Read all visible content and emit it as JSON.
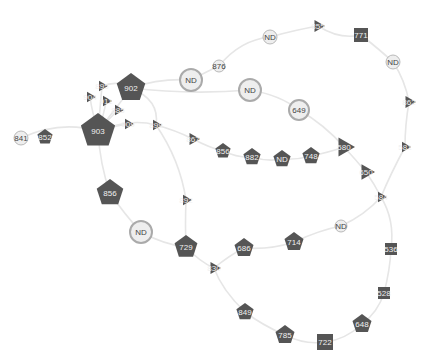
{
  "diagram": {
    "type": "network-graph",
    "colors": {
      "dark_node": "#555555",
      "light_node_fill": "#eeeeee",
      "light_node_stroke": "#aaaaaa",
      "edge": "#e6e6e6"
    },
    "nodes": [
      {
        "id": "n841",
        "label": "841",
        "shape": "circle-plain",
        "x": 21,
        "y": 138,
        "r": 7
      },
      {
        "id": "n852",
        "label": "852",
        "shape": "pentagon",
        "x": 45,
        "y": 137,
        "r": 8
      },
      {
        "id": "n903",
        "label": "903",
        "shape": "pentagon",
        "x": 98,
        "y": 131,
        "r": 18
      },
      {
        "id": "n902",
        "label": "902",
        "shape": "pentagon",
        "x": 131,
        "y": 88,
        "r": 15
      },
      {
        "id": "n895",
        "label": "895",
        "shape": "triangle",
        "x": 102,
        "y": 86,
        "r": 6
      },
      {
        "id": "n904",
        "label": "904",
        "shape": "triangle",
        "x": 90,
        "y": 97,
        "r": 6
      },
      {
        "id": "n911",
        "label": "911",
        "shape": "triangle",
        "x": 106,
        "y": 101,
        "r": 6
      },
      {
        "id": "n885",
        "label": "885",
        "shape": "triangle",
        "x": 118,
        "y": 110,
        "r": 6
      },
      {
        "id": "n909",
        "label": "909",
        "shape": "triangle",
        "x": 128,
        "y": 124,
        "r": 6
      },
      {
        "id": "n899",
        "label": "899",
        "shape": "triangle",
        "x": 156,
        "y": 125,
        "r": 6
      },
      {
        "id": "nND1",
        "label": "ND",
        "shape": "circle-ring",
        "x": 191,
        "y": 80,
        "r": 11
      },
      {
        "id": "n876",
        "label": "876",
        "shape": "circle-plain",
        "x": 219,
        "y": 66,
        "r": 6
      },
      {
        "id": "nND2",
        "label": "ND",
        "shape": "circle-ring",
        "x": 250,
        "y": 90,
        "r": 11
      },
      {
        "id": "nND3",
        "label": "ND",
        "shape": "circle-plain",
        "x": 270,
        "y": 37,
        "r": 7
      },
      {
        "id": "n649",
        "label": "649",
        "shape": "circle-ring",
        "x": 299,
        "y": 110,
        "r": 10
      },
      {
        "id": "n855",
        "label": "855",
        "shape": "triangle",
        "x": 318,
        "y": 26,
        "r": 7
      },
      {
        "id": "n771",
        "label": "771",
        "shape": "square",
        "x": 361,
        "y": 35,
        "r": 7
      },
      {
        "id": "nND4",
        "label": "ND",
        "shape": "circle-plain",
        "x": 393,
        "y": 62,
        "r": 7
      },
      {
        "id": "n862",
        "label": "862",
        "shape": "triangle",
        "x": 409,
        "y": 102,
        "r": 7
      },
      {
        "id": "n581",
        "label": "581",
        "shape": "triangle",
        "x": 405,
        "y": 147,
        "r": 6
      },
      {
        "id": "n867",
        "label": "867",
        "shape": "triangle",
        "x": 193,
        "y": 139,
        "r": 7
      },
      {
        "id": "n856",
        "label": "856",
        "shape": "pentagon",
        "x": 223,
        "y": 151,
        "r": 8
      },
      {
        "id": "n882",
        "label": "882",
        "shape": "pentagon",
        "x": 252,
        "y": 157,
        "r": 9
      },
      {
        "id": "nNDp",
        "label": "ND",
        "shape": "pentagon",
        "x": 282,
        "y": 159,
        "r": 9
      },
      {
        "id": "n748",
        "label": "748",
        "shape": "pentagon",
        "x": 311,
        "y": 156,
        "r": 9
      },
      {
        "id": "n580",
        "label": "580",
        "shape": "triangle",
        "x": 344,
        "y": 147,
        "r": 11
      },
      {
        "id": "n650",
        "label": "650",
        "shape": "triangle",
        "x": 366,
        "y": 172,
        "r": 9
      },
      {
        "id": "n584",
        "label": "584",
        "shape": "triangle",
        "x": 381,
        "y": 197,
        "r": 6
      },
      {
        "id": "n856b",
        "label": "856",
        "shape": "pentagon",
        "x": 110,
        "y": 193,
        "r": 14
      },
      {
        "id": "n892",
        "label": "892",
        "shape": "triangle",
        "x": 186,
        "y": 200,
        "r": 6
      },
      {
        "id": "nND5",
        "label": "ND",
        "shape": "circle-ring",
        "x": 141,
        "y": 232,
        "r": 11
      },
      {
        "id": "n729",
        "label": "729",
        "shape": "pentagon",
        "x": 186,
        "y": 247,
        "r": 12
      },
      {
        "id": "n686",
        "label": "686",
        "shape": "pentagon",
        "x": 244,
        "y": 248,
        "r": 10
      },
      {
        "id": "n714",
        "label": "714",
        "shape": "pentagon",
        "x": 294,
        "y": 242,
        "r": 10
      },
      {
        "id": "nND6",
        "label": "ND",
        "shape": "circle-plain",
        "x": 341,
        "y": 226,
        "r": 6
      },
      {
        "id": "n830",
        "label": "830",
        "shape": "triangle",
        "x": 214,
        "y": 268,
        "r": 7
      },
      {
        "id": "n536",
        "label": "536",
        "shape": "square",
        "x": 391,
        "y": 249,
        "r": 6
      },
      {
        "id": "n528",
        "label": "528",
        "shape": "square",
        "x": 384,
        "y": 293,
        "r": 6
      },
      {
        "id": "n849",
        "label": "849",
        "shape": "pentagon",
        "x": 245,
        "y": 312,
        "r": 9
      },
      {
        "id": "n785",
        "label": "785",
        "shape": "pentagon",
        "x": 285,
        "y": 335,
        "r": 10
      },
      {
        "id": "n722",
        "label": "722",
        "shape": "square",
        "x": 325,
        "y": 342,
        "r": 8
      },
      {
        "id": "n648",
        "label": "648",
        "shape": "pentagon",
        "x": 362,
        "y": 324,
        "r": 10
      }
    ],
    "edges": [
      {
        "d": "M21 138 Q60 120 98 131"
      },
      {
        "d": "M98 131 Q115 110 131 88"
      },
      {
        "d": "M98 131 Q100 108 102 86"
      },
      {
        "d": "M98 131 Q92 112 90 97"
      },
      {
        "d": "M98 131 Q104 115 106 101"
      },
      {
        "d": "M98 131 Q110 118 118 110"
      },
      {
        "d": "M98 131 Q114 126 128 124"
      },
      {
        "d": "M98 131 Q130 118 156 125"
      },
      {
        "d": "M131 88 Q160 78 191 80"
      },
      {
        "d": "M102 86 Q118 80 131 88"
      },
      {
        "d": "M131 88 Q160 100 156 125"
      },
      {
        "d": "M191 80 Q210 70 219 66"
      },
      {
        "d": "M219 66 Q240 40 270 37"
      },
      {
        "d": "M270 37 Q295 30 318 26"
      },
      {
        "d": "M318 26 Q340 40 361 35"
      },
      {
        "d": "M361 35 Q380 50 393 62"
      },
      {
        "d": "M393 62 Q405 80 409 102"
      },
      {
        "d": "M409 102 Q405 125 405 147"
      },
      {
        "d": "M405 147 Q390 175 381 197"
      },
      {
        "d": "M131 88 Q190 95 250 90"
      },
      {
        "d": "M250 90 Q280 95 299 110"
      },
      {
        "d": "M299 110 Q325 125 344 147"
      },
      {
        "d": "M156 125 Q175 130 193 139"
      },
      {
        "d": "M193 139 Q210 148 223 151"
      },
      {
        "d": "M223 151 Q238 158 252 157"
      },
      {
        "d": "M252 157 Q268 162 282 159"
      },
      {
        "d": "M282 159 Q297 160 311 156"
      },
      {
        "d": "M311 156 Q330 152 344 147"
      },
      {
        "d": "M344 147 Q356 160 366 172"
      },
      {
        "d": "M366 172 Q375 185 381 197"
      },
      {
        "d": "M98 131 Q100 165 110 193"
      },
      {
        "d": "M110 193 Q125 215 141 232"
      },
      {
        "d": "M141 232 Q165 245 186 247"
      },
      {
        "d": "M156 125 Q180 160 186 200"
      },
      {
        "d": "M186 200 Q185 225 186 247"
      },
      {
        "d": "M186 247 Q200 262 214 268"
      },
      {
        "d": "M214 268 Q230 255 244 248"
      },
      {
        "d": "M244 248 Q270 250 294 242"
      },
      {
        "d": "M294 242 Q320 230 341 226"
      },
      {
        "d": "M341 226 Q365 215 381 197"
      },
      {
        "d": "M381 197 Q395 220 391 249"
      },
      {
        "d": "M391 249 Q390 270 384 293"
      },
      {
        "d": "M384 293 Q378 312 362 324"
      },
      {
        "d": "M362 324 Q345 340 325 342"
      },
      {
        "d": "M325 342 Q305 345 285 335"
      },
      {
        "d": "M285 335 Q262 325 245 312"
      },
      {
        "d": "M245 312 Q222 290 214 268"
      }
    ]
  }
}
